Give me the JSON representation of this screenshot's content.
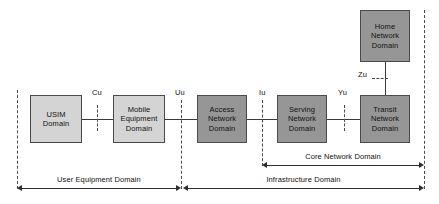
{
  "diagram": {
    "colors": {
      "light_box": "#d4d4d4",
      "dark_box": "#969696",
      "box_border": "#4a4a4a",
      "line": "#3a3a3a",
      "background": "#ffffff"
    },
    "nodes": [
      {
        "id": "usim-domain",
        "lines": [
          "USIM",
          "Domain"
        ],
        "shade": "light",
        "x": 30,
        "y": 95,
        "w": 52,
        "h": 48
      },
      {
        "id": "mobile-equipment-domain",
        "lines": [
          "Mobile",
          "Equipment",
          "Domain"
        ],
        "shade": "light",
        "x": 113,
        "y": 95,
        "w": 52,
        "h": 48
      },
      {
        "id": "access-network-domain",
        "lines": [
          "Access",
          "Network",
          "Domain"
        ],
        "shade": "dark",
        "x": 197,
        "y": 95,
        "w": 50,
        "h": 48
      },
      {
        "id": "serving-network-domain",
        "lines": [
          "Serving",
          "Network",
          "Domain"
        ],
        "shade": "dark",
        "x": 277,
        "y": 95,
        "w": 50,
        "h": 48
      },
      {
        "id": "transit-network-domain",
        "lines": [
          "Transit",
          "Network",
          "Domain"
        ],
        "shade": "dark",
        "x": 360,
        "y": 95,
        "w": 50,
        "h": 48
      },
      {
        "id": "home-network-domain",
        "lines": [
          "Home",
          "Network",
          "Domain"
        ],
        "shade": "dark",
        "x": 360,
        "y": 10,
        "w": 50,
        "h": 52
      }
    ],
    "interfaces": [
      {
        "id": "cu",
        "label": "Cu",
        "x": 92,
        "y": 88
      },
      {
        "id": "uu",
        "label": "Uu",
        "x": 175,
        "y": 88
      },
      {
        "id": "iu",
        "label": "Iu",
        "x": 258,
        "y": 88
      },
      {
        "id": "yu",
        "label": "Yu",
        "x": 338,
        "y": 88
      },
      {
        "id": "zu",
        "label": "Zu",
        "x": 358,
        "y": 70
      }
    ],
    "spans": [
      {
        "id": "user-equipment-domain",
        "label": "User Equipment Domain",
        "x1": 17,
        "x2": 181,
        "y": 188,
        "label_y": 175
      },
      {
        "id": "infrastructure-domain",
        "label": "Infrastructure Domain",
        "x1": 183,
        "x2": 424,
        "y": 188,
        "label_y": 175
      },
      {
        "id": "core-network-domain",
        "label": "Core Network Domain",
        "x1": 262,
        "x2": 424,
        "y": 165,
        "label_y": 152
      }
    ]
  }
}
